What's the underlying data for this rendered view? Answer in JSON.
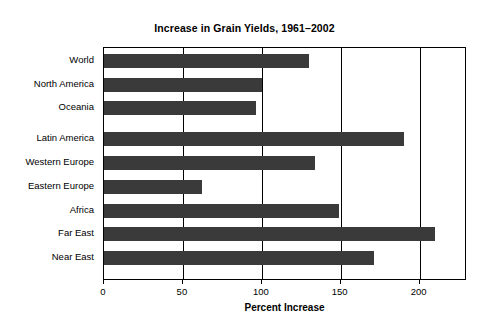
{
  "chart_data": {
    "type": "bar",
    "orientation": "horizontal",
    "title": "Increase in Grain Yields, 1961–2002",
    "xlabel": "Percent Increase",
    "ylabel": "",
    "xlim": [
      0,
      230
    ],
    "xticks": [
      0,
      50,
      100,
      150,
      200
    ],
    "xtick_labels": [
      "0",
      "50",
      "100",
      "150",
      "200"
    ],
    "grid": true,
    "grid_axis": "x",
    "legend": false,
    "bar_color": "#3a3a3a",
    "categories": [
      "World",
      "North America",
      "Oceania",
      "Latin America",
      "Western Europe",
      "Eastern Europe",
      "Africa",
      "Far East",
      "Near East"
    ],
    "values": [
      130,
      100,
      96,
      190,
      134,
      62,
      149,
      210,
      171
    ],
    "group_break_after_index": 2
  }
}
